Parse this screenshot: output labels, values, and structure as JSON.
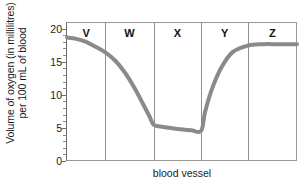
{
  "chart_data": {
    "type": "line",
    "title": "",
    "subtitle": "",
    "xlabel": "blood vessel",
    "ylabel_line1": "Volume of oxygen (in millilitres)",
    "ylabel_line2": "per 100 mL of blood",
    "ylim": [
      0,
      21
    ],
    "ytick_values": [
      0,
      5,
      10,
      15,
      20
    ],
    "ytick_labels": [
      "0",
      "5",
      "10",
      "15",
      "20"
    ],
    "yminor_step": 1,
    "grid": false,
    "legend": "none",
    "xlim": [
      0,
      100
    ],
    "xtick_labels": [],
    "segments": [
      {
        "label": "V",
        "x_start": 0.0,
        "x_end": 16.5,
        "center": 8.3
      },
      {
        "label": "W",
        "x_start": 16.5,
        "x_end": 37.8,
        "center": 27.2
      },
      {
        "label": "X",
        "x_start": 37.8,
        "x_end": 58.3,
        "center": 48.0
      },
      {
        "label": "Y",
        "x_start": 58.3,
        "x_end": 78.7,
        "center": 68.5
      },
      {
        "label": "Z",
        "x_start": 78.7,
        "x_end": 100.0,
        "center": 89.3
      }
    ],
    "series": [
      {
        "name": "oxygen volume",
        "color": "#8a8a8a",
        "linewidth": 4,
        "x": [
          0,
          4,
          8,
          12,
          16.5,
          21,
          25,
          29,
          33,
          36,
          37.8,
          42,
          48,
          54,
          58.3,
          60,
          63,
          67,
          72,
          78.7,
          85,
          92,
          100
        ],
        "y": [
          18.8,
          18.6,
          18.2,
          17.5,
          16.6,
          15.3,
          13.6,
          11.4,
          8.8,
          6.8,
          5.6,
          5.3,
          5.0,
          4.8,
          4.7,
          7.5,
          11.0,
          14.2,
          16.6,
          17.6,
          17.8,
          17.8,
          17.8
        ]
      }
    ],
    "annotations": [
      {
        "text": "V",
        "type": "segment-label"
      },
      {
        "text": "W",
        "type": "segment-label"
      },
      {
        "text": "X",
        "type": "segment-label"
      },
      {
        "text": "Y",
        "type": "segment-label"
      },
      {
        "text": "Z",
        "type": "segment-label"
      }
    ]
  }
}
